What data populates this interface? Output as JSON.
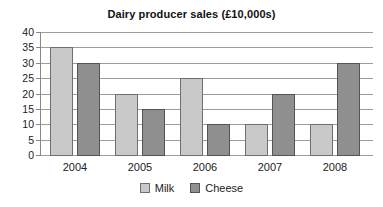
{
  "chart_data": {
    "type": "bar",
    "title": "Dairy producer sales (£10,000s)",
    "categories": [
      "2004",
      "2005",
      "2006",
      "2007",
      "2008"
    ],
    "series": [
      {
        "name": "Milk",
        "values": [
          35,
          20,
          25,
          10,
          10
        ],
        "fill": "#c9c9c9",
        "border": "#6f6f6f"
      },
      {
        "name": "Cheese",
        "values": [
          30,
          15,
          10,
          20,
          30
        ],
        "fill": "#8f8f8f",
        "border": "#545454"
      }
    ],
    "ylabel": "",
    "xlabel": "",
    "ylim": [
      0,
      40
    ],
    "ytick_step": 5,
    "ytick_labels": [
      "0",
      "5",
      "10",
      "15",
      "20",
      "25",
      "30",
      "35",
      "40"
    ],
    "grid": true,
    "legend_position": "bottom"
  },
  "legend": {
    "milk_label": "Milk",
    "cheese_label": "Cheese"
  },
  "colors": {
    "gridline": "#9c9c9c",
    "axis": "#888888",
    "text": "#1c1c1c",
    "background": "#ffffff"
  }
}
